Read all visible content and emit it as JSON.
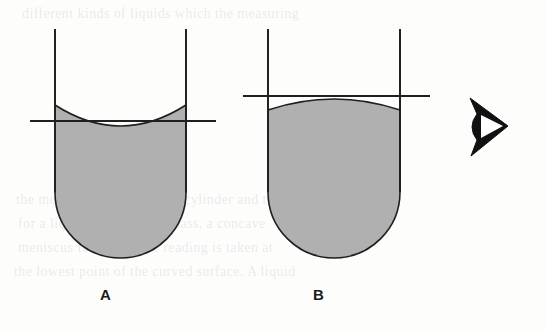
{
  "figure": {
    "background_color": "#fdfdfc",
    "liquid_fill_color": "#b0b0b0",
    "outline_color": "#1f1f1f",
    "labels": [
      {
        "id": "a",
        "text": "A",
        "x": 100,
        "y": 287
      },
      {
        "id": "b",
        "text": "B",
        "x": 313,
        "y": 287
      }
    ],
    "eye_symbol": {
      "name": "eye-icon",
      "description": "stylized eye indicating line of sight / viewing direction",
      "x": 468,
      "y": 98,
      "width": 40,
      "height": 58,
      "color": "#111111"
    },
    "tubes": [
      {
        "id": "a",
        "label": "A",
        "meniscus_shape": "concave",
        "wall_left_x": 55,
        "wall_right_x": 186,
        "wall_top_y": 29,
        "bottom_y": 258,
        "reference_line_y": 121,
        "reference_line_x1": 30,
        "reference_line_x2": 216,
        "liquid_surface_center_y": 126,
        "liquid_surface_edge_y": 105
      },
      {
        "id": "b",
        "label": "B",
        "meniscus_shape": "convex",
        "wall_left_x": 268,
        "wall_right_x": 400,
        "wall_top_y": 29,
        "bottom_y": 258,
        "reference_line_y": 96,
        "reference_line_x1": 243,
        "reference_line_x2": 430,
        "liquid_surface_center_y": 99,
        "liquid_surface_edge_y": 110
      }
    ]
  },
  "ghost_text": {
    "color": "rgba(120,120,124,0.155)",
    "lines": [
      {
        "text": "different kinds of liquids which the measuring",
        "x": 22,
        "y": 6,
        "size": 14
      },
      {
        "text": "the mouth of the measuring cylinder and the",
        "x": 16,
        "y": 192,
        "size": 14
      },
      {
        "text": "for a liquid that wets the glass, a concave",
        "x": 18,
        "y": 216,
        "size": 14
      },
      {
        "text": "meniscus forms and the reading is taken at",
        "x": 18,
        "y": 240,
        "size": 14
      },
      {
        "text": "the lowest point of the curved surface. A liquid",
        "x": 14,
        "y": 264,
        "size": 14
      }
    ]
  }
}
